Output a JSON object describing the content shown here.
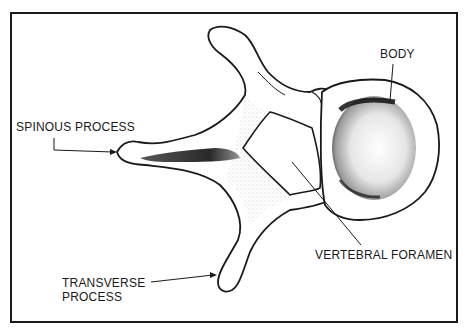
{
  "diagram": {
    "labels": {
      "body": "BODY",
      "spinous_process": "SPINOUS PROCESS",
      "vertebral_foramen": "VERTEBRAL FORAMEN",
      "transverse_process_line1": "TRANSVERSE",
      "transverse_process_line2": "PROCESS"
    },
    "colors": {
      "ink": "#1a1a1a",
      "background": "#ffffff",
      "shading": "#555555"
    }
  }
}
